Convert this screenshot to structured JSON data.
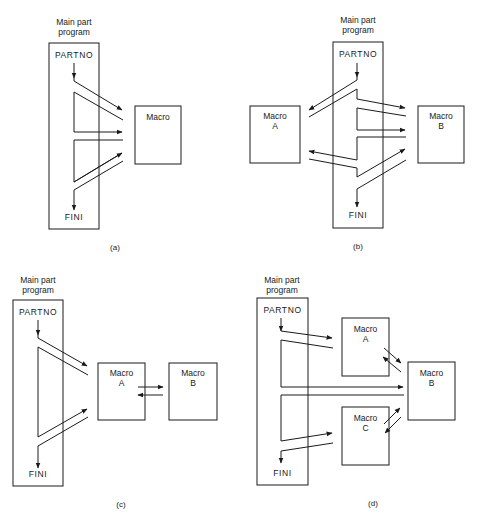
{
  "figure": {
    "panels": [
      {
        "id": "a",
        "caption": "(a)",
        "main_title_line1": "Main part",
        "main_title_line2": "program",
        "start_label": "PARTNO",
        "end_label": "FINI",
        "macros": [
          {
            "line1": "Macro",
            "line2": ""
          }
        ]
      },
      {
        "id": "b",
        "caption": "(b)",
        "main_title_line1": "Main part",
        "main_title_line2": "program",
        "start_label": "PARTNO",
        "end_label": "FINI",
        "macros": [
          {
            "line1": "Macro",
            "line2": "A"
          },
          {
            "line1": "Macro",
            "line2": "B"
          }
        ]
      },
      {
        "id": "c",
        "caption": "(c)",
        "main_title_line1": "Main part",
        "main_title_line2": "program",
        "start_label": "PARTNO",
        "end_label": "FINI",
        "macros": [
          {
            "line1": "Macro",
            "line2": "A"
          },
          {
            "line1": "Macro",
            "line2": "B"
          }
        ]
      },
      {
        "id": "d",
        "caption": "(d)",
        "main_title_line1": "Main part",
        "main_title_line2": "program",
        "start_label": "PARTNO",
        "end_label": "FINI",
        "macros": [
          {
            "line1": "Macro",
            "line2": "A"
          },
          {
            "line1": "Macro",
            "line2": "B"
          },
          {
            "line1": "Macro",
            "line2": "C"
          }
        ]
      }
    ],
    "colors": {
      "line": "#1a1a1a",
      "background": "#ffffff"
    }
  }
}
